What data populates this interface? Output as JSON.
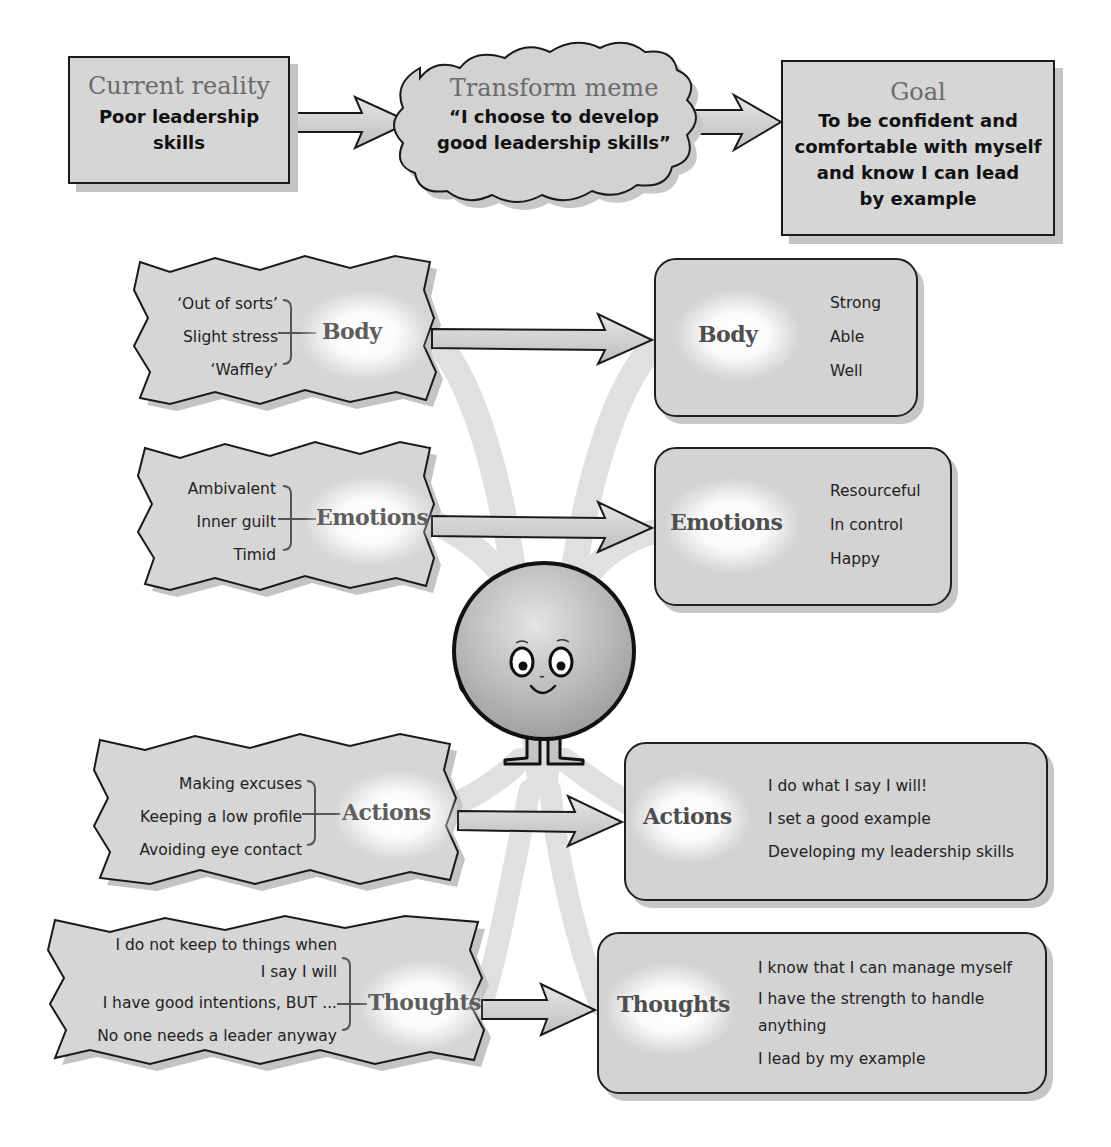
{
  "top_row": {
    "current_reality": {
      "title": "Current reality",
      "lines": [
        "Poor leadership",
        "skills"
      ]
    },
    "transform_meme": {
      "title": "Transform meme",
      "lines": [
        "“I choose to develop",
        "good leadership skills”"
      ]
    },
    "goal": {
      "title": "Goal",
      "lines": [
        "To be confident and",
        "comfortable with myself",
        "and know I can lead",
        "by example"
      ]
    }
  },
  "left_panels": [
    {
      "category": "Body",
      "items": [
        "‘Out of sorts’",
        "Slight stress",
        "‘Waffley’"
      ]
    },
    {
      "category": "Emotions",
      "items": [
        "Ambivalent",
        "Inner guilt",
        "Timid"
      ]
    },
    {
      "category": "Actions",
      "items": [
        "Making excuses",
        "Keeping a low profile",
        "Avoiding eye contact"
      ]
    },
    {
      "category": "Thoughts",
      "items": [
        "I do not keep to things when",
        "I say I will",
        "I have good intentions, BUT ...",
        "No one needs a leader anyway"
      ]
    }
  ],
  "right_panels": [
    {
      "category": "Body",
      "items": [
        "Strong",
        "Able",
        "Well"
      ]
    },
    {
      "category": "Emotions",
      "items": [
        "Resourceful",
        "In control",
        "Happy"
      ]
    },
    {
      "category": "Actions",
      "items": [
        "I do what I say I will!",
        "I set a good example",
        "Developing my leadership skills"
      ]
    },
    {
      "category": "Thoughts",
      "items": [
        "I know that I can manage myself",
        "I have the strength to handle",
        "anything",
        "I lead by my example"
      ]
    }
  ],
  "figure": {
    "name": "smiling-character"
  },
  "colors": {
    "box_fill": "#d6d6d6",
    "outline": "#1a1a1a",
    "shadow": "#c4c4c4",
    "title_gray": "#6a6a6a",
    "arrow_fill": "#cfcfcf",
    "swoosh": "#e2e2e2"
  }
}
